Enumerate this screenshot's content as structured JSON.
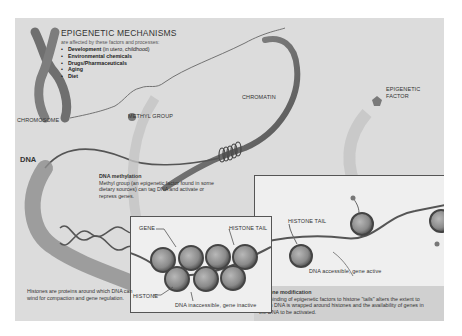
{
  "diagram": {
    "title": "EPIGENETIC MECHANISMS",
    "subtitle": "are affected by these factors and processes:",
    "factors": [
      {
        "label": "Development",
        "note": " (in utero, childhood)"
      },
      {
        "label": "Environmental chemicals",
        "note": ""
      },
      {
        "label": "Drugs/Pharmaceuticals",
        "note": ""
      },
      {
        "label": "Aging",
        "note": ""
      },
      {
        "label": "Diet",
        "note": ""
      }
    ],
    "labels": {
      "chromosome": "CHROMOSOME",
      "chromatin": "CHROMATIN",
      "methyl_group": "METHYL GROUP",
      "epigenetic_factor_line1": "EPIGENETIC",
      "epigenetic_factor_line2": "FACTOR",
      "dna": "DNA",
      "gene": "GENE",
      "histone_tail_left": "HISTONE TAIL",
      "histone_tail_right": "HISTONE TAIL",
      "histone": "HISTONE",
      "dna_inaccessible": "DNA inaccessible, gene inactive",
      "dna_accessible": "DNA accessible, gene active"
    },
    "dna_methylation": {
      "heading": "DNA methylation",
      "body": "Methyl group (an epigenetic factor found in some dietary sources) can tag DNA and activate or repress genes."
    },
    "histones_note": "Histones are proteins around which DNA can wind for compaction and gene regulation.",
    "histone_modification": {
      "heading": "Histone modification",
      "body": "The binding of epigenetic factors to histone \"tails\" alters the extent to which DNA is wrapped around histones and the availability of genes in the DNA to be activated."
    },
    "colors": {
      "background": "#dcdcdc",
      "panel": "#efefef",
      "histone": "#8a8a8a",
      "strand": "#5a5a5a"
    }
  }
}
